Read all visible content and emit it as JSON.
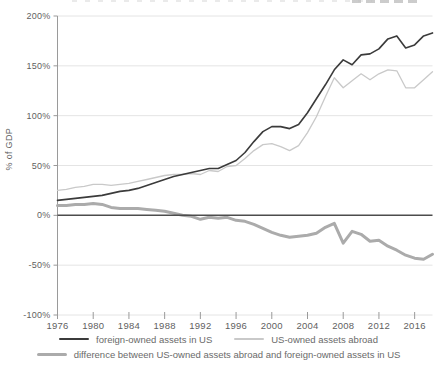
{
  "chart_data": {
    "type": "line",
    "title": "",
    "xlabel": "",
    "ylabel": "% of GDP",
    "xlim": [
      1976,
      2018
    ],
    "ylim": [
      -100,
      200
    ],
    "grid": true,
    "legend_position": "bottom",
    "x_tick_values": [
      1976,
      1980,
      1984,
      1988,
      1992,
      1996,
      2000,
      2004,
      2008,
      2012,
      2016
    ],
    "x_tick_labels": [
      "1976",
      "1980",
      "1984",
      "1988",
      "1992",
      "1996",
      "2000",
      "2004",
      "2008",
      "2012",
      "2016"
    ],
    "y_tick_values": [
      200,
      150,
      100,
      50,
      0,
      -50,
      -100
    ],
    "y_tick_labels": [
      "200%",
      "150%",
      "100%",
      "50%",
      "0%",
      "-50%",
      "-100%"
    ],
    "x": [
      1976,
      1977,
      1978,
      1979,
      1980,
      1981,
      1982,
      1983,
      1984,
      1985,
      1986,
      1987,
      1988,
      1989,
      1990,
      1991,
      1992,
      1993,
      1994,
      1995,
      1996,
      1997,
      1998,
      1999,
      2000,
      2001,
      2002,
      2003,
      2004,
      2005,
      2006,
      2007,
      2008,
      2009,
      2010,
      2011,
      2012,
      2013,
      2014,
      2015,
      2016,
      2017,
      2018
    ],
    "series": [
      {
        "name": "foreign-owned assets in US",
        "color": "#3b3b3b",
        "stroke_width": 1.6,
        "values": [
          15,
          16,
          17,
          18,
          19,
          20,
          22,
          24,
          25,
          27,
          30,
          33,
          36,
          39,
          41,
          43,
          45,
          47,
          47,
          51,
          55,
          63,
          74,
          84,
          89,
          89,
          87,
          91,
          103,
          117,
          131,
          146,
          156,
          151,
          161,
          162,
          167,
          177,
          180,
          168,
          171,
          180,
          183
        ]
      },
      {
        "name": "US-owned assets abroad",
        "color": "#c9c9c9",
        "stroke_width": 1.3,
        "values": [
          25,
          26,
          28,
          29,
          31,
          31,
          30,
          31,
          32,
          34,
          36,
          38,
          40,
          41,
          41,
          42,
          41,
          45,
          44,
          49,
          50,
          57,
          65,
          71,
          72,
          69,
          65,
          70,
          83,
          99,
          119,
          138,
          128,
          135,
          142,
          136,
          142,
          146,
          145,
          128,
          128,
          136,
          144
        ]
      },
      {
        "name": "difference between US-owned assets abroad and foreign-owned assets in US",
        "color": "#ababab",
        "stroke_width": 3,
        "values": [
          10,
          10,
          11,
          11,
          12,
          11,
          8,
          7,
          7,
          7,
          6,
          5,
          4,
          2,
          0,
          -1,
          -4,
          -2,
          -3,
          -2,
          -5,
          -6,
          -9,
          -13,
          -17,
          -20,
          -22,
          -21,
          -20,
          -18,
          -12,
          -8,
          -28,
          -16,
          -19,
          -26,
          -25,
          -31,
          -35,
          -40,
          -43,
          -44,
          -39
        ]
      }
    ],
    "colors": {
      "zero_line": "#4d4d4d",
      "axis": "#9a9a9a",
      "gridline": "#e4e4e4",
      "tick_label": "#5f5f5f",
      "legend_text": "#6a6a6a"
    }
  }
}
